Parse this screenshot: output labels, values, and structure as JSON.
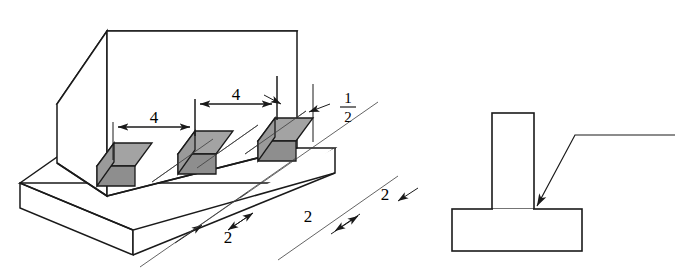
{
  "figure": {
    "background_color": "#ffffff",
    "line_color": "#1a1a1a",
    "weld_fill_color": "#a3a3a3",
    "weld_shade_color": "#8e8e8e",
    "thin_line_color": "#3c3c3c"
  },
  "isometric_view": {
    "name": "isometric-weldment",
    "base_plate_label": "base-plate",
    "upright_plate_label": "upright-plate",
    "weld_beads": [
      {
        "id": "weld-bead-1",
        "position": "left"
      },
      {
        "id": "weld-bead-2",
        "position": "center"
      },
      {
        "id": "weld-bead-3",
        "position": "right"
      }
    ]
  },
  "dimensions": {
    "pitch": [
      {
        "id": "pitch-dim-1",
        "value": "4"
      },
      {
        "id": "pitch-dim-2",
        "value": "4"
      }
    ],
    "leg_size": {
      "id": "leg-size-dim",
      "numerator": "1",
      "denominator": "2",
      "value": "1/2"
    },
    "weld_length": [
      {
        "id": "length-dim-1",
        "value": "2"
      },
      {
        "id": "length-dim-2",
        "value": "2"
      },
      {
        "id": "length-dim-3",
        "value": "2"
      }
    ]
  },
  "section_view": {
    "name": "tee-section-view",
    "vertical_member_label": "vertical-member",
    "horizontal_member_label": "horizontal-member",
    "leader": {
      "id": "weld-leader-line",
      "description": "leader pointing to tee joint root"
    }
  }
}
